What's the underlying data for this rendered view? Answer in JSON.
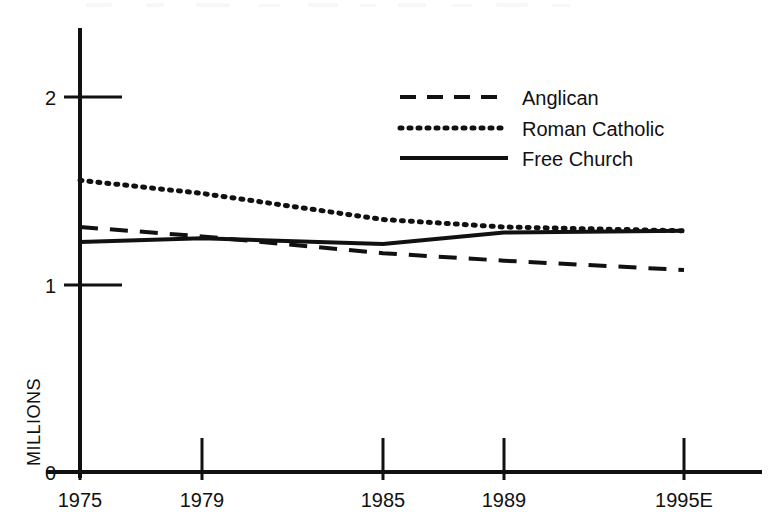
{
  "chart_data": {
    "type": "line",
    "title": "",
    "subtitle": "",
    "xlabel": "",
    "ylabel": "MILLIONS",
    "x": [
      "1975",
      "1979",
      "1985",
      "1989",
      "1995E"
    ],
    "x_tick_labels": [
      "1975",
      "1979",
      "1985",
      "1989",
      "1995E"
    ],
    "y_tick_labels": [
      "0",
      "1",
      "2"
    ],
    "y_ticks": [
      0,
      1,
      2
    ],
    "ylim": [
      0,
      2.35
    ],
    "grid": false,
    "legend_position": "top-right",
    "series": [
      {
        "name": "Anglican",
        "style": "dashed",
        "color": "#111111",
        "values": [
          1.31,
          1.26,
          1.17,
          1.13,
          1.08
        ]
      },
      {
        "name": "Roman Catholic",
        "style": "dotted",
        "color": "#111111",
        "values": [
          1.56,
          1.49,
          1.35,
          1.31,
          1.29
        ]
      },
      {
        "name": "Free Church",
        "style": "solid",
        "color": "#111111",
        "values": [
          1.23,
          1.25,
          1.22,
          1.28,
          1.29
        ]
      }
    ],
    "annotations": []
  },
  "axis": {
    "y_label": "MILLIONS",
    "y_tick_2": "2",
    "y_tick_1": "1",
    "y_tick_0": "0",
    "x_tick_1975": "1975",
    "x_tick_1979": "1979",
    "x_tick_1985": "1985",
    "x_tick_1989": "1989",
    "x_tick_1995": "1995E"
  },
  "legend": {
    "entry_1": "Anglican",
    "entry_2": "Roman Catholic",
    "entry_3": "Free Church"
  },
  "colors": {
    "ink": "#111111",
    "background": "#ffffff"
  }
}
